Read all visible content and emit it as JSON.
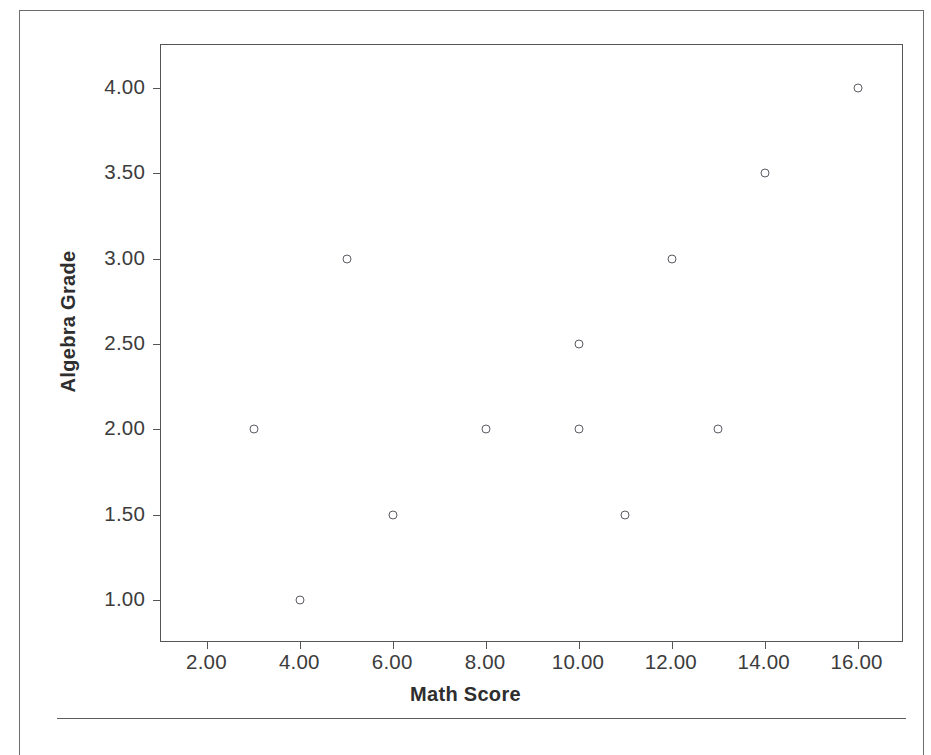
{
  "chart_data": {
    "type": "scatter",
    "title": "",
    "xlabel": "Math Score",
    "ylabel": "Algebra Grade",
    "xlim": [
      1.0,
      17.0
    ],
    "ylim": [
      0.75,
      4.25
    ],
    "grid": false,
    "legend": "none",
    "marker_style": "open-circle",
    "marker_color": "#5a5a63",
    "xticks": [
      2,
      4,
      6,
      8,
      10,
      12,
      14,
      16
    ],
    "xtick_labels": [
      "2.00",
      "4.00",
      "6.00",
      "8.00",
      "10.00",
      "12.00",
      "14.00",
      "16.00"
    ],
    "yticks": [
      1.0,
      1.5,
      2.0,
      2.5,
      3.0,
      3.5,
      4.0
    ],
    "ytick_labels": [
      "1.00",
      "1.50",
      "2.00",
      "2.50",
      "3.00",
      "3.50",
      "4.00"
    ],
    "points": [
      {
        "x": 3,
        "y": 2.0
      },
      {
        "x": 4,
        "y": 1.0
      },
      {
        "x": 5,
        "y": 3.0
      },
      {
        "x": 6,
        "y": 1.5
      },
      {
        "x": 8,
        "y": 2.0
      },
      {
        "x": 10,
        "y": 2.0
      },
      {
        "x": 10,
        "y": 2.5
      },
      {
        "x": 11,
        "y": 1.5
      },
      {
        "x": 12,
        "y": 3.0
      },
      {
        "x": 13,
        "y": 2.0
      },
      {
        "x": 14,
        "y": 3.5
      },
      {
        "x": 16,
        "y": 4.0
      }
    ]
  },
  "colors": {
    "frame": "#555555",
    "marker": "#5a5a63",
    "text": "#3c3c3c",
    "title_text": "#2e2e2e",
    "page_border": "#6d6d6d",
    "background": "#ffffff"
  }
}
